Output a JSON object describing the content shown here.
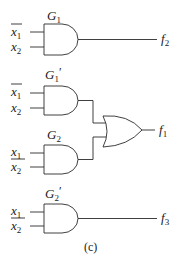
{
  "diagram": {
    "caption": "(c)",
    "colors": {
      "line": "#2a2a2a",
      "text": "#1a1a1a",
      "background": "#ffffff"
    },
    "gates": [
      {
        "id": "G1",
        "type": "AND",
        "label_main": "G",
        "label_sub": "1",
        "label_prime": "",
        "inputs": [
          {
            "var": "x",
            "sub": "1",
            "complemented": true
          },
          {
            "var": "x",
            "sub": "2",
            "complemented": false
          }
        ],
        "output": {
          "var": "f",
          "sub": "2"
        }
      },
      {
        "id": "G1p",
        "type": "AND",
        "label_main": "G",
        "label_sub": "1",
        "label_prime": "′",
        "inputs": [
          {
            "var": "x",
            "sub": "1",
            "complemented": true
          },
          {
            "var": "x",
            "sub": "2",
            "complemented": false
          }
        ],
        "output": {
          "to": "OR"
        }
      },
      {
        "id": "G2",
        "type": "AND",
        "label_main": "G",
        "label_sub": "2",
        "label_prime": "",
        "inputs": [
          {
            "var": "x",
            "sub": "1",
            "complemented": false
          },
          {
            "var": "x",
            "sub": "2",
            "complemented": false
          }
        ],
        "output": {
          "to": "OR"
        }
      },
      {
        "id": "OR",
        "type": "OR",
        "output": {
          "var": "f",
          "sub": "1"
        }
      },
      {
        "id": "G2p",
        "type": "AND",
        "label_main": "G",
        "label_sub": "2",
        "label_prime": "′",
        "inputs": [
          {
            "var": "x",
            "sub": "1",
            "complemented": false
          },
          {
            "var": "x",
            "sub": "2",
            "complemented": false
          }
        ],
        "output": {
          "var": "f",
          "sub": "3"
        }
      }
    ]
  }
}
